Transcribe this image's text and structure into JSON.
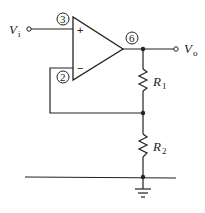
{
  "diagram": {
    "type": "non-inverting-amplifier",
    "input": {
      "label": "V",
      "sub": "i"
    },
    "output": {
      "label": "V",
      "sub": "o"
    },
    "opamp": {
      "pins": {
        "noninverting": "3",
        "inverting": "2",
        "output": "6"
      },
      "plus_sign": "+",
      "minus_sign": "−"
    },
    "resistors": [
      {
        "label": "R",
        "sub": "1"
      },
      {
        "label": "R",
        "sub": "2"
      }
    ],
    "color": "#222222"
  }
}
